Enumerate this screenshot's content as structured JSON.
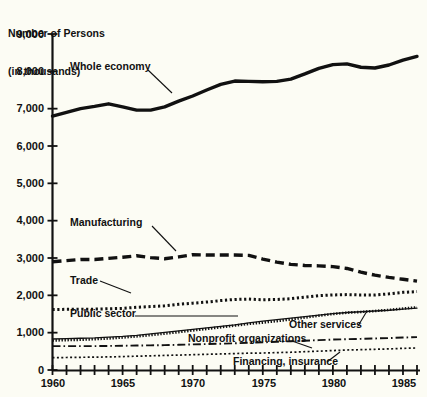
{
  "chart_data": {
    "type": "line",
    "title": "Number of Persons\n(in thousands)",
    "title_line1": "Number of Persons",
    "title_line2": "(in thousands)",
    "xlabel": "",
    "ylabel": "Number of Persons (in thousands)",
    "xlim": [
      1960,
      1986
    ],
    "ylim": [
      0,
      9000
    ],
    "grid": false,
    "legend_position": "inline-annotations",
    "y_ticks": [
      0,
      1000,
      2000,
      3000,
      4000,
      5000,
      6000,
      7000,
      8000,
      9000
    ],
    "y_tick_labels": [
      "0",
      "1,000",
      "2,000",
      "3,000",
      "4,000",
      "5,000",
      "6,000",
      "7,000",
      "8,000",
      "9,000"
    ],
    "x_ticks": [
      1960,
      1961,
      1962,
      1963,
      1964,
      1965,
      1966,
      1967,
      1968,
      1969,
      1970,
      1971,
      1972,
      1973,
      1974,
      1975,
      1976,
      1977,
      1978,
      1979,
      1980,
      1981,
      1982,
      1983,
      1984,
      1985,
      1986
    ],
    "x_tick_labels_shown": [
      "1960",
      "1965",
      "1970",
      "1975",
      "1980",
      "1985"
    ],
    "x_labeled_years": [
      1960,
      1965,
      1970,
      1975,
      1980,
      1985
    ],
    "x": [
      1960,
      1961,
      1962,
      1963,
      1964,
      1965,
      1966,
      1967,
      1968,
      1969,
      1970,
      1971,
      1972,
      1973,
      1974,
      1975,
      1976,
      1977,
      1978,
      1979,
      1980,
      1981,
      1982,
      1983,
      1984,
      1985,
      1986
    ],
    "series": [
      {
        "name": "Whole economy",
        "style": "solid-thick",
        "color": "#111111",
        "values": [
          6800,
          6900,
          7000,
          7060,
          7130,
          7050,
          6960,
          6960,
          7050,
          7200,
          7340,
          7500,
          7650,
          7740,
          7730,
          7720,
          7730,
          7790,
          7930,
          8080,
          8180,
          8200,
          8110,
          8090,
          8170,
          8300,
          8400
        ]
      },
      {
        "name": "Manufacturing",
        "style": "dashed-thick",
        "color": "#111111",
        "values": [
          2900,
          2930,
          2960,
          2960,
          2990,
          3020,
          3060,
          3010,
          2980,
          3030,
          3090,
          3080,
          3080,
          3080,
          3070,
          2970,
          2890,
          2830,
          2800,
          2790,
          2770,
          2720,
          2620,
          2540,
          2480,
          2430,
          2380
        ]
      },
      {
        "name": "Trade",
        "style": "dotted-square",
        "color": "#111111",
        "values": [
          1620,
          1625,
          1630,
          1630,
          1640,
          1650,
          1680,
          1700,
          1720,
          1760,
          1790,
          1820,
          1860,
          1890,
          1900,
          1880,
          1890,
          1910,
          1950,
          1990,
          2010,
          2020,
          2010,
          2010,
          2040,
          2080,
          2100
        ]
      },
      {
        "name": "Public sector",
        "style": "solid-thin",
        "color": "#111111",
        "values": [
          830,
          840,
          850,
          860,
          880,
          900,
          930,
          970,
          1010,
          1050,
          1090,
          1130,
          1170,
          1210,
          1260,
          1310,
          1350,
          1390,
          1430,
          1470,
          1510,
          1540,
          1560,
          1580,
          1600,
          1630,
          1660
        ]
      },
      {
        "name": "Other services",
        "style": "dotted-fine-bold",
        "color": "#111111",
        "values": [
          790,
          800,
          810,
          825,
          845,
          870,
          900,
          935,
          975,
          1015,
          1060,
          1100,
          1145,
          1190,
          1235,
          1270,
          1310,
          1355,
          1405,
          1455,
          1500,
          1535,
          1555,
          1580,
          1610,
          1645,
          1680
        ]
      },
      {
        "name": "Nonprofit organizations",
        "style": "dash-dot",
        "color": "#111111",
        "values": [
          640,
          640,
          640,
          640,
          645,
          650,
          655,
          660,
          665,
          675,
          685,
          695,
          705,
          715,
          730,
          740,
          755,
          770,
          785,
          800,
          815,
          825,
          835,
          845,
          855,
          870,
          880
        ]
      },
      {
        "name": "Financing, insurance",
        "style": "dotted-fine",
        "color": "#111111",
        "values": [
          330,
          335,
          340,
          345,
          350,
          360,
          370,
          380,
          390,
          400,
          410,
          420,
          430,
          440,
          450,
          455,
          465,
          475,
          490,
          505,
          520,
          535,
          545,
          555,
          565,
          580,
          590
        ]
      }
    ],
    "annotations": [
      {
        "text": "Whole economy",
        "x_px": 70,
        "y_px": 66
      },
      {
        "text": "Manufacturing",
        "x_px": 70,
        "y_px": 222
      },
      {
        "text": "Trade",
        "x_px": 70,
        "y_px": 280
      },
      {
        "text": "Public sector",
        "x_px": 70,
        "y_px": 312
      },
      {
        "text": "Other services",
        "x_px": 289,
        "y_px": 322
      },
      {
        "text": "Nonprofit organizations",
        "x_px": 188,
        "y_px": 337
      },
      {
        "text": "Financing, insurance",
        "x_px": 233,
        "y_px": 360
      }
    ]
  },
  "axes": {
    "y_label_0": "0",
    "y_label_1000": "1,000",
    "y_label_2000": "2,000",
    "y_label_3000": "3,000",
    "y_label_4000": "4,000",
    "y_label_5000": "5,000",
    "y_label_6000": "6,000",
    "y_label_7000": "7,000",
    "y_label_8000": "8,000",
    "y_label_9000": "9,000",
    "x_label_1960": "1960",
    "x_label_1965": "1965",
    "x_label_1970": "1970",
    "x_label_1975": "1975",
    "x_label_1980": "1980",
    "x_label_1985": "1985"
  },
  "labels": {
    "title_line1": "Number of Persons",
    "title_line2": "(in thousands)",
    "whole_economy": "Whole economy",
    "manufacturing": "Manufacturing",
    "trade": "Trade",
    "public_sector": "Public sector",
    "other_services": "Other services",
    "nonprofit": "Nonprofit organizations",
    "financing": "Financing, insurance"
  }
}
